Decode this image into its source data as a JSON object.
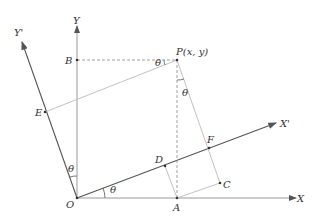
{
  "diagram": {
    "colors": {
      "axis": "#777777",
      "dark": "#444444",
      "light": "#bbbbbb",
      "text": "#333333"
    },
    "labels": {
      "Y": "Y",
      "Yprime": "Y'",
      "X": "X",
      "Xprime": "X'",
      "O": "O",
      "A": "A",
      "B": "B",
      "C": "C",
      "D": "D",
      "E": "E",
      "F": "F",
      "P": "P(x, y)",
      "theta": "θ"
    },
    "points": {
      "O": [
        77,
        198
      ],
      "A": [
        177,
        198
      ],
      "B": [
        77,
        60
      ],
      "P": [
        177,
        60
      ],
      "C": [
        220,
        183
      ],
      "D": [
        165,
        166
      ],
      "E": [
        45,
        112
      ],
      "F": [
        209,
        148
      ]
    }
  }
}
